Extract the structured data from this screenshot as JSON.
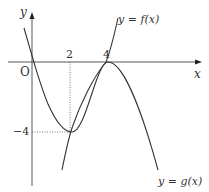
{
  "diagram": {
    "axes": {
      "x_label": "x",
      "y_label": "y",
      "origin_label": "O"
    },
    "ticks": {
      "x": [
        "2",
        "4"
      ],
      "y": [
        "−4"
      ]
    },
    "curves": [
      {
        "name": "f",
        "label": "y = f(x)"
      },
      {
        "name": "g",
        "label": "y = g(x)"
      }
    ],
    "points": [
      {
        "x": 0,
        "y": 0
      },
      {
        "x": 2,
        "y": -4
      },
      {
        "x": 4,
        "y": 0
      }
    ],
    "colors": {
      "stroke": "#333333",
      "dotted": "#555555"
    }
  }
}
